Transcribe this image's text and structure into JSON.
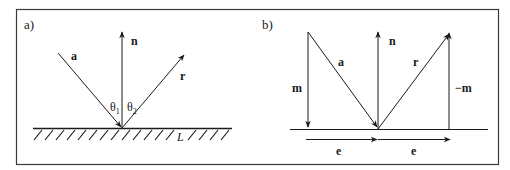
{
  "figure": {
    "panel_a": {
      "label": "a)",
      "vectors": {
        "incident": "a",
        "normal": "n",
        "reflected": "r"
      },
      "angles": {
        "incidence": "θ₁",
        "incidence_base": "θ",
        "incidence_sub": "1",
        "reflection_base": "θ",
        "reflection_sub": "2"
      },
      "surface": "L"
    },
    "panel_b": {
      "label": "b)",
      "vectors": {
        "incident": "a",
        "normal": "n",
        "reflected": "r",
        "m": "m",
        "neg_m": "−m",
        "e1": "e",
        "e2": "e"
      }
    },
    "colors": {
      "stroke": "#1a1a1a",
      "frame": "#3a3a3a",
      "background": "#ffffff"
    }
  }
}
